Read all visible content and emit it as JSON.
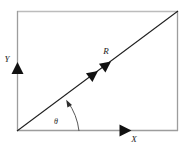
{
  "figure": {
    "background_color": "#ffffff",
    "frame": {
      "name": "rectangle-frame",
      "left": 17,
      "top": 11,
      "right": 178,
      "bottom": 131,
      "top_edge_color": "#b8b8b8",
      "left_edge_color": "#9a9a9a",
      "right_edge_color": "#9a9a9a",
      "bottom_edge_color": "#9a9a9a",
      "stroke_width": 1.2
    },
    "labels": {
      "x_axis": "X",
      "y_axis": "Y",
      "resultant": "R",
      "angle": "θ"
    },
    "label_positions": {
      "x_axis": {
        "x": 133,
        "y": 141
      },
      "y_axis": {
        "x": 10,
        "y": 62
      },
      "resultant": {
        "x": 106,
        "y": 54
      },
      "angle": {
        "x": 56,
        "y": 124
      }
    },
    "colors": {
      "line": "#1a1a1a",
      "arrowhead": "#111111",
      "arc": "#555555",
      "label": "#1a1a1a"
    },
    "diagonal": {
      "name": "resultant-vector-line",
      "from": {
        "x": 17,
        "y": 131
      },
      "to": {
        "x": 178,
        "y": 11
      },
      "stroke_width": 1.0,
      "arrowheads": 2,
      "arrowhead_positions": [
        {
          "x": 98,
          "y": 71
        },
        {
          "x": 110,
          "y": 62
        }
      ]
    },
    "x_arrow": {
      "name": "x-component-arrow",
      "tip": {
        "x": 131,
        "y": 131
      },
      "size": 11
    },
    "y_arrow": {
      "name": "y-component-arrow",
      "tip": {
        "x": 17,
        "y": 62
      },
      "size": 11
    },
    "angle_arc": {
      "name": "angle-arc",
      "center": {
        "x": 17,
        "y": 131
      },
      "radius": 62,
      "start_deg": 0,
      "end_deg": 36.7,
      "stroke_width": 0.9
    }
  }
}
